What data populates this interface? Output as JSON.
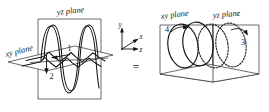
{
  "figure": {
    "relation_symbol": "=",
    "left_diagram": {
      "name": "linear-components-diagram",
      "plane_labels": [
        {
          "id": "yz",
          "text": "yz plane"
        },
        {
          "id": "xy",
          "text": "xy plane"
        }
      ],
      "component_labels": [
        {
          "id": "component-1",
          "text": "1"
        },
        {
          "id": "component-2",
          "text": "2"
        }
      ]
    },
    "axes": {
      "name": "coordinate-axis-triad",
      "labels": [
        {
          "id": "y",
          "text": "y"
        },
        {
          "id": "x",
          "text": "x"
        },
        {
          "id": "z",
          "text": "z"
        }
      ]
    },
    "right_diagram": {
      "name": "circular-components-diagram",
      "plane_labels": [
        {
          "id": "xy",
          "text": "xy plane"
        },
        {
          "id": "yz",
          "text": "yz plane"
        }
      ],
      "component_labels": [
        {
          "id": "component-3",
          "text": "3"
        },
        {
          "id": "component-4",
          "text": "4"
        }
      ]
    },
    "colors": {
      "background": "#ffffff",
      "ink": "#141414",
      "line": "#2b2b2b"
    }
  }
}
